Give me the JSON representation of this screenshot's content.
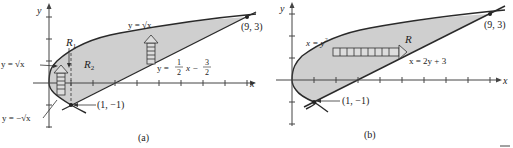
{
  "figure": {
    "panels": [
      {
        "id": "a",
        "caption": "(a)",
        "axis_x_label": "x",
        "axis_y_label": "y",
        "region_labels": [
          "R",
          "1",
          "R",
          "2"
        ],
        "curve_labels": {
          "upper_left": "y = √x",
          "upper_right": "y = √x",
          "lower_left": "y = −√x",
          "line_prefix": "y = ",
          "line_frac1_num": "1",
          "line_frac1_den": "2",
          "line_mid": "x −",
          "line_frac2_num": "3",
          "line_frac2_den": "2"
        },
        "points": [
          {
            "label": "(1, −1)"
          },
          {
            "label": "(9, 3)"
          }
        ]
      },
      {
        "id": "b",
        "caption": "(b)",
        "axis_x_label": "x",
        "axis_y_label": "y",
        "region_label": "R",
        "curve_labels": {
          "parabola_base": "x = y",
          "parabola_exp": "2",
          "line": "x = 2y + 3"
        },
        "points": [
          {
            "label": "(1, −1)"
          },
          {
            "label": "(9, 3)"
          }
        ]
      }
    ],
    "colors": {
      "region_fill": "#cfcfcf",
      "curve": "#2a2a2a",
      "axis": "#444444"
    }
  }
}
